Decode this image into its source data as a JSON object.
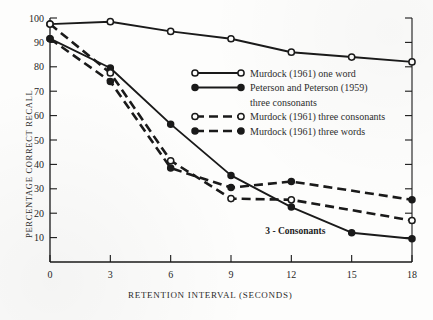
{
  "chart_data": {
    "type": "line",
    "title": "",
    "xlabel": "RETENTION INTERVAL (SECONDS)",
    "ylabel": "PERCENTAGE CORRECT RECALL",
    "x": [
      0,
      3,
      6,
      9,
      12,
      15,
      18
    ],
    "xlim": [
      0,
      18
    ],
    "ylim": [
      0,
      100
    ],
    "xticks": [
      "0",
      "3",
      "6",
      "9",
      "12",
      "15",
      "18"
    ],
    "yticks": [
      "10",
      "20",
      "30",
      "40",
      "50",
      "60",
      "70",
      "80",
      "90",
      "100"
    ],
    "grid": false,
    "legend_position": "center-right",
    "annotations": [
      {
        "text": "3 - Consonants",
        "x": 12.2,
        "y": 11.5
      }
    ],
    "series": [
      {
        "name": "Murdock (1961) one word",
        "marker": "open-circle",
        "line": "solid",
        "color": "#1a1a1a",
        "x": [
          0,
          3,
          6,
          9,
          12,
          15,
          18
        ],
        "values": [
          97.5,
          98.5,
          94.5,
          91.5,
          86,
          84,
          82
        ]
      },
      {
        "name": "Peterson and Peterson (1959) three consonants",
        "marker": "filled-circle",
        "line": "solid",
        "color": "#1a1a1a",
        "x": [
          0,
          3,
          6,
          9,
          12,
          15,
          18
        ],
        "values": [
          91.5,
          79.5,
          56.5,
          35.5,
          22.5,
          12,
          9.5
        ]
      },
      {
        "name": "Murdock (1961) three consonants",
        "marker": "open-circle",
        "line": "dashed",
        "color": "#1a1a1a",
        "x": [
          0,
          3,
          6,
          9,
          12,
          18
        ],
        "values": [
          97.5,
          77.5,
          41.5,
          26,
          25.5,
          17
        ]
      },
      {
        "name": "Murdock (1961) three words",
        "marker": "filled-circle",
        "line": "dashed",
        "color": "#1a1a1a",
        "x": [
          0,
          3,
          6,
          9,
          12,
          18
        ],
        "values": [
          91.5,
          74,
          38.5,
          30.5,
          33,
          25.5
        ]
      }
    ]
  },
  "legend": {
    "entries": [
      {
        "label": "Murdock (1961) one word",
        "marker": "open-circle",
        "line": "solid"
      },
      {
        "label": "Peterson and Peterson (1959)",
        "marker": "filled-circle",
        "line": "solid"
      },
      {
        "label": "three consonants",
        "marker": "none",
        "line": "none"
      },
      {
        "label": "Murdock (1961) three consonants",
        "marker": "open-circle",
        "line": "dashed"
      },
      {
        "label": "Murdock (1961) three words",
        "marker": "filled-circle",
        "line": "dashed"
      }
    ]
  },
  "axes": {
    "x_title": "RETENTION INTERVAL (SECONDS)",
    "y_title": "PERCENTAGE CORRECT RECALL"
  },
  "colors": {
    "ink": "#1a1a1a",
    "paper": "#fdfdfc",
    "text": "#2b2b2b"
  }
}
